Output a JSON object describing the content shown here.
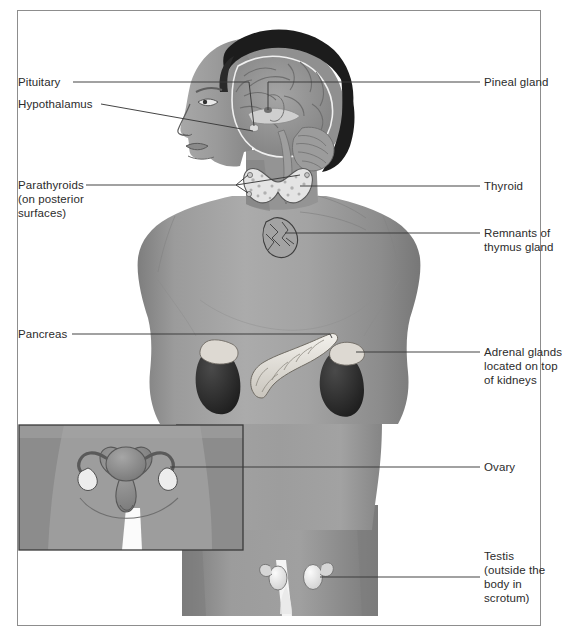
{
  "figure": {
    "type": "anatomical-diagram",
    "frame": {
      "border_color": "#8d8d8d",
      "background": "#ffffff"
    },
    "body": {
      "orientation": "head in left profile, torso facing front",
      "skin_gray": "#9a9a9a",
      "hair_color": "#1e1e1e",
      "outline_color": "#4a4a4a"
    },
    "inset": {
      "name": "female-pelvis-inset",
      "border_color": "#3a3a3a",
      "contents": "uterus, fallopian tubes and ovaries in female pelvis"
    }
  },
  "labels_left": [
    {
      "id": "pituitary",
      "text": "Pituitary",
      "lines": [
        "Pituitary"
      ]
    },
    {
      "id": "hypothalamus",
      "text": "Hypothalamus",
      "lines": [
        "Hypothalamus"
      ]
    },
    {
      "id": "parathyroids",
      "text": "Parathyroids (on posterior surfaces)",
      "lines": [
        "Parathyroids",
        "(on posterior",
        "surfaces)"
      ]
    },
    {
      "id": "pancreas",
      "text": "Pancreas",
      "lines": [
        "Pancreas"
      ]
    }
  ],
  "labels_right": [
    {
      "id": "pineal-gland",
      "text": "Pineal gland",
      "lines": [
        "Pineal gland"
      ]
    },
    {
      "id": "thyroid",
      "text": "Thyroid",
      "lines": [
        "Thyroid"
      ]
    },
    {
      "id": "thymus",
      "text": "Remnants of thymus gland",
      "lines": [
        "Remnants of",
        "thymus gland"
      ]
    },
    {
      "id": "adrenal-glands",
      "text": "Adrenal glands located on top of kidneys",
      "lines": [
        "Adrenal glands",
        "located on top",
        "of kidneys"
      ]
    },
    {
      "id": "ovary",
      "text": "Ovary",
      "lines": [
        "Ovary"
      ]
    },
    {
      "id": "testis",
      "text": "Testis (outside the body in scrotum)",
      "lines": [
        "Testis",
        "(outside the",
        "body in",
        "scrotum)"
      ]
    }
  ],
  "label_text": {
    "pituitary": "Pituitary",
    "hypothalamus": "Hypothalamus",
    "parathyroids_1": "Parathyroids",
    "parathyroids_2": "(on posterior",
    "parathyroids_3": "surfaces)",
    "pancreas": "Pancreas",
    "pineal": "Pineal gland",
    "thyroid": "Thyroid",
    "thymus_1": "Remnants of",
    "thymus_2": "thymus gland",
    "adrenal_1": "Adrenal glands",
    "adrenal_2": "located on top",
    "adrenal_3": "of kidneys",
    "ovary": "Ovary",
    "testis_1": "Testis",
    "testis_2": "(outside the",
    "testis_3": "body in",
    "testis_4": "scrotum)"
  },
  "organs": [
    {
      "id": "brain",
      "name": "brain",
      "fill": "#8e8e8e"
    },
    {
      "id": "pineal",
      "name": "pineal-gland",
      "fill": "#7a7a7a"
    },
    {
      "id": "pituitary",
      "name": "pituitary-gland",
      "fill": "#d8d8d8"
    },
    {
      "id": "thyroid",
      "name": "thyroid-gland",
      "fill": "#e2e2e2"
    },
    {
      "id": "parathyroid",
      "name": "parathyroid-glands",
      "fill": "#cfcfcf"
    },
    {
      "id": "thymus",
      "name": "thymus-remnant",
      "fill": "#a7a7a7"
    },
    {
      "id": "pancreas",
      "name": "pancreas",
      "fill": "#e6e3dc"
    },
    {
      "id": "kidney",
      "name": "kidney",
      "fill": "#2a2a2a"
    },
    {
      "id": "adrenal",
      "name": "adrenal-gland",
      "fill": "#ddd9d2"
    },
    {
      "id": "uterus",
      "name": "uterus",
      "fill": "#8a8a8a"
    },
    {
      "id": "ovary",
      "name": "ovary",
      "fill": "#ededed"
    },
    {
      "id": "testis",
      "name": "testis",
      "fill": "#eaeaea"
    }
  ]
}
